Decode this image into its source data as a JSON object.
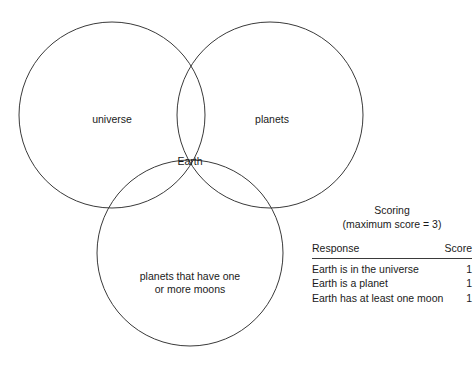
{
  "diagram": {
    "type": "venn-3-set",
    "stroke_color": "#3a3a3a",
    "background_color": "#ffffff",
    "circles": [
      {
        "id": "universe",
        "label": "universe",
        "cx": 112,
        "cy": 115,
        "r": 93
      },
      {
        "id": "planets",
        "label": "planets",
        "cx": 270,
        "cy": 115,
        "r": 93
      },
      {
        "id": "moons",
        "label": "planets that have one or more moons",
        "cx": 190,
        "cy": 253,
        "r": 93
      }
    ],
    "labels": {
      "universe": "universe",
      "planets": "planets",
      "intersection": "Earth",
      "moons_line1": "planets that have one",
      "moons_line2": "or more moons"
    }
  },
  "scoring": {
    "title": "Scoring",
    "subtitle": "(maximum score = 3)",
    "columns": {
      "response": "Response",
      "score": "Score"
    },
    "rows": [
      {
        "response": "Earth is in the universe",
        "score": "1"
      },
      {
        "response": "Earth is a planet",
        "score": "1"
      },
      {
        "response": "Earth has at least one moon",
        "score": "1"
      }
    ],
    "maximum_score": "3"
  }
}
